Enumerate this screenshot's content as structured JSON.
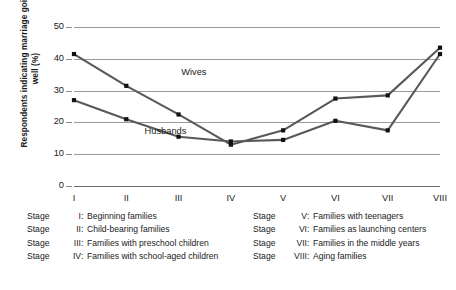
{
  "chart_data": {
    "type": "line",
    "title": "",
    "xlabel": "",
    "ylabel": "Respondents indicating marriage going well (%)",
    "categories": [
      "I",
      "II",
      "III",
      "IV",
      "V",
      "VI",
      "VII",
      "VIII"
    ],
    "ylim": [
      0,
      50
    ],
    "yticks": [
      0,
      10,
      20,
      30,
      40,
      50
    ],
    "grid": "horizontal",
    "legend_position": "inline-labels",
    "series": [
      {
        "name": "Wives",
        "color": "#595959",
        "values": [
          41.5,
          31.5,
          22.5,
          13.0,
          17.5,
          27.5,
          28.5,
          43.5
        ]
      },
      {
        "name": "Husbands",
        "color": "#595959",
        "values": [
          27.0,
          21.0,
          15.5,
          14.0,
          14.5,
          20.5,
          17.5,
          41.5
        ]
      }
    ],
    "annotations": [
      {
        "text": "Wives",
        "x": 2.05,
        "y": 35.5
      },
      {
        "text": "Husbands",
        "x": 1.35,
        "y": 17.0
      }
    ]
  },
  "legend": {
    "stage_word": "Stage",
    "left_column": [
      {
        "numeral": "I",
        "description": "Beginning families"
      },
      {
        "numeral": "II",
        "description": "Child-bearing families"
      },
      {
        "numeral": "III",
        "description": "Families with preschool children"
      },
      {
        "numeral": "IV",
        "description": "Families with school-aged children"
      }
    ],
    "right_column": [
      {
        "numeral": "V",
        "description": "Families with teenagers"
      },
      {
        "numeral": "VI",
        "description": "Families as launching centers"
      },
      {
        "numeral": "VII",
        "description": "Families in the middle years"
      },
      {
        "numeral": "VIII",
        "description": "Aging families"
      }
    ]
  }
}
